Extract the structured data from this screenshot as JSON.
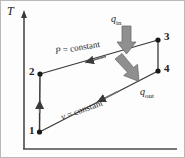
{
  "figure": {
    "axes": {
      "y_label": "T",
      "x_label": ""
    },
    "states": [
      {
        "id": "1",
        "label": "1",
        "x": 38,
        "y": 131
      },
      {
        "id": "2",
        "label": "2",
        "x": 39,
        "y": 73
      },
      {
        "id": "3",
        "label": "3",
        "x": 157,
        "y": 39
      },
      {
        "id": "4",
        "label": "4",
        "x": 157,
        "y": 70
      }
    ],
    "processes": [
      {
        "id": "3-2",
        "label": "P = constant",
        "symbol": "P",
        "eq": " = constant"
      },
      {
        "id": "4-1",
        "label": "v = constant",
        "symbol": "v",
        "eq": " = constant"
      }
    ],
    "heat": [
      {
        "id": "q-in",
        "base": "q",
        "sub": "in",
        "label": "q_in",
        "direction": "down"
      },
      {
        "id": "q-out",
        "base": "q",
        "sub": "out",
        "label": "q_out",
        "direction": "down-right"
      }
    ],
    "colors": {
      "line": "#3a3a3a",
      "axis": "#4a4a4a",
      "arrow_fill": "#8a8a8a",
      "arrow_stroke": "#6d6d6d",
      "point": "#1a1a1a",
      "text": "#222222",
      "background": "#fdfdfd",
      "border": "#b9b9b9"
    }
  }
}
